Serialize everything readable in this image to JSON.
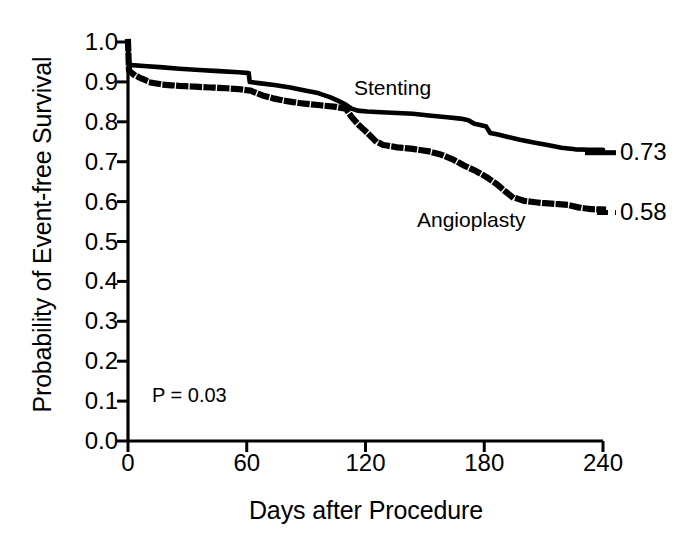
{
  "chart_data": {
    "type": "line",
    "title": "",
    "subtitle": "",
    "xlabel": "Days after Procedure",
    "ylabel": "Probability of Event-free Survival",
    "xlim": [
      0,
      240
    ],
    "ylim": [
      0.0,
      1.0
    ],
    "xticks": [
      0,
      60,
      120,
      180,
      240
    ],
    "xtick_labels": [
      "0",
      "60",
      "120",
      "180",
      "240"
    ],
    "yticks": [
      0.0,
      0.1,
      0.2,
      0.3,
      0.4,
      0.5,
      0.6,
      0.7,
      0.8,
      0.9,
      1.0
    ],
    "ytick_labels": [
      "0.0",
      "0.1",
      "0.2",
      "0.3",
      "0.4",
      "0.5",
      "0.6",
      "0.7",
      "0.8",
      "0.9",
      "1.0"
    ],
    "grid": false,
    "legend_position": "inline-annotations",
    "annotations": [
      {
        "name": "p-value",
        "text": "P = 0.03",
        "x": 12,
        "y": 0.115
      },
      {
        "name": "series-label-stenting",
        "text": "Stenting",
        "x": 114,
        "y": 0.905
      },
      {
        "name": "series-label-angioplasty",
        "text": "Angioplasty",
        "x": 146,
        "y": 0.575
      }
    ],
    "end_labels": [
      {
        "series": "Stenting",
        "text": "0.73",
        "value": 0.73
      },
      {
        "series": "Angioplasty",
        "text": "0.58",
        "value": 0.58
      }
    ],
    "series": [
      {
        "name": "Stenting",
        "style": "solid",
        "color": "#000000",
        "final_value": 0.73,
        "points": [
          [
            0,
            1.0
          ],
          [
            0.5,
            0.945
          ],
          [
            2,
            0.942
          ],
          [
            8,
            0.94
          ],
          [
            16,
            0.937
          ],
          [
            26,
            0.933
          ],
          [
            36,
            0.93
          ],
          [
            46,
            0.927
          ],
          [
            56,
            0.924
          ],
          [
            61,
            0.922
          ],
          [
            61.5,
            0.9
          ],
          [
            66,
            0.897
          ],
          [
            74,
            0.892
          ],
          [
            82,
            0.886
          ],
          [
            90,
            0.878
          ],
          [
            96,
            0.872
          ],
          [
            102,
            0.862
          ],
          [
            106,
            0.853
          ],
          [
            110,
            0.843
          ],
          [
            113,
            0.833
          ],
          [
            116,
            0.828
          ],
          [
            121,
            0.826
          ],
          [
            128,
            0.824
          ],
          [
            136,
            0.822
          ],
          [
            144,
            0.82
          ],
          [
            152,
            0.816
          ],
          [
            160,
            0.812
          ],
          [
            168,
            0.808
          ],
          [
            172,
            0.804
          ],
          [
            175,
            0.795
          ],
          [
            178,
            0.792
          ],
          [
            181,
            0.788
          ],
          [
            183,
            0.772
          ],
          [
            187,
            0.768
          ],
          [
            192,
            0.762
          ],
          [
            198,
            0.755
          ],
          [
            205,
            0.748
          ],
          [
            212,
            0.742
          ],
          [
            219,
            0.735
          ],
          [
            226,
            0.731
          ],
          [
            233,
            0.73
          ],
          [
            240,
            0.73
          ]
        ]
      },
      {
        "name": "Angioplasty",
        "style": "dotted",
        "color": "#000000",
        "final_value": 0.58,
        "points": [
          [
            0,
            1.0
          ],
          [
            0.5,
            0.928
          ],
          [
            3,
            0.918
          ],
          [
            7,
            0.908
          ],
          [
            12,
            0.898
          ],
          [
            18,
            0.893
          ],
          [
            26,
            0.89
          ],
          [
            34,
            0.888
          ],
          [
            42,
            0.886
          ],
          [
            50,
            0.884
          ],
          [
            56,
            0.882
          ],
          [
            62,
            0.878
          ],
          [
            68,
            0.866
          ],
          [
            74,
            0.858
          ],
          [
            80,
            0.852
          ],
          [
            88,
            0.846
          ],
          [
            96,
            0.842
          ],
          [
            104,
            0.838
          ],
          [
            110,
            0.833
          ],
          [
            113,
            0.812
          ],
          [
            117,
            0.79
          ],
          [
            121,
            0.772
          ],
          [
            125,
            0.752
          ],
          [
            129,
            0.742
          ],
          [
            136,
            0.736
          ],
          [
            144,
            0.732
          ],
          [
            152,
            0.726
          ],
          [
            158,
            0.718
          ],
          [
            164,
            0.706
          ],
          [
            170,
            0.69
          ],
          [
            176,
            0.676
          ],
          [
            181,
            0.662
          ],
          [
            186,
            0.645
          ],
          [
            190,
            0.628
          ],
          [
            194,
            0.612
          ],
          [
            200,
            0.602
          ],
          [
            208,
            0.597
          ],
          [
            216,
            0.594
          ],
          [
            222,
            0.592
          ],
          [
            228,
            0.585
          ],
          [
            234,
            0.581
          ],
          [
            240,
            0.58
          ]
        ]
      }
    ]
  },
  "axes": {
    "x_title": "Days after Procedure",
    "y_title": "Probability of Event-free Survival"
  }
}
